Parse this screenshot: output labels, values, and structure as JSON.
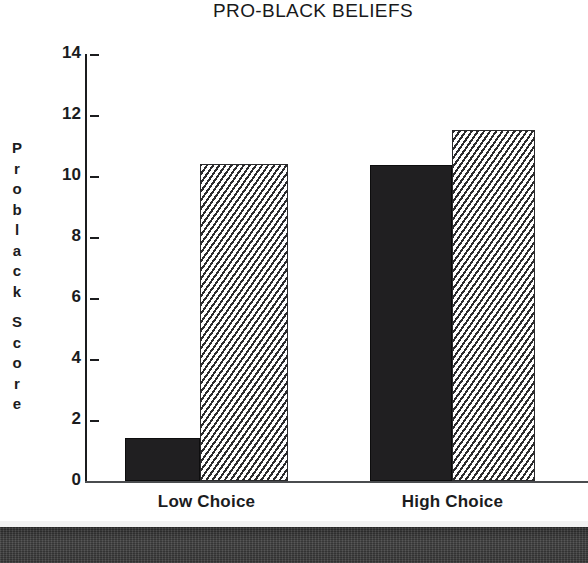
{
  "chart_data": {
    "type": "bar",
    "title": "PRO-BLACK BELIEFS",
    "xlabel": "",
    "ylabel": "Problack Score",
    "categories": [
      "Low Choice",
      "High Choice"
    ],
    "series": [
      {
        "name": "solid",
        "values": [
          1.4,
          10.35
        ]
      },
      {
        "name": "hatched",
        "values": [
          10.4,
          11.5
        ]
      }
    ],
    "ylim": [
      0,
      14
    ],
    "yticks": [
      0,
      2,
      4,
      6,
      8,
      10,
      12,
      14
    ],
    "ytick_labels": [
      "0",
      "2",
      "4",
      "6",
      "8",
      "10",
      "12",
      "14"
    ],
    "grid": false,
    "legend": "none",
    "bar_fills": [
      "solid-black",
      "diagonal-hatch"
    ]
  },
  "y_axis_title_letters": [
    "P",
    "r",
    "o",
    "b",
    "l",
    "a",
    "c",
    "k",
    "S",
    "c",
    "o",
    "r",
    "e"
  ],
  "caption": {
    "text": "Figure 2"
  }
}
